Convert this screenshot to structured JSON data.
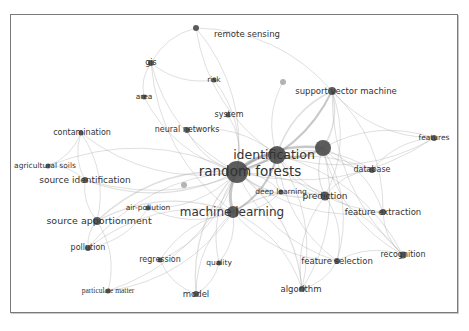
{
  "diagram": {
    "type": "keyword co-occurrence network",
    "colors": {
      "node": "#4a4a4a",
      "node_light": "#a0a0a0",
      "edge": "#9a9a9a",
      "frame": "#7a7a7a",
      "label": "#333333"
    },
    "nodes": [
      {
        "id": "random_forests",
        "label": "random forests",
        "x": 237,
        "y": 172,
        "r": 11,
        "lx": 250,
        "ly": 172,
        "fs": 13.5
      },
      {
        "id": "identification",
        "label": "identification",
        "x": 277,
        "y": 155,
        "r": 9,
        "lx": 274,
        "ly": 155,
        "fs": 12.5
      },
      {
        "id": "hub",
        "label": "",
        "x": 323,
        "y": 148,
        "r": 8,
        "lx": 0,
        "ly": 0,
        "fs": 0
      },
      {
        "id": "machine_learning",
        "label": "machine learning",
        "x": 233,
        "y": 212,
        "r": 6,
        "lx": 232,
        "ly": 212,
        "fs": 12
      },
      {
        "id": "support_vector_machine",
        "label": "support vector machine",
        "x": 332,
        "y": 91,
        "r": 4,
        "lx": 346,
        "ly": 91,
        "fs": 8.5
      },
      {
        "id": "remote_sensing",
        "label": "remote sensing",
        "x": 196,
        "y": 28,
        "r": 3,
        "lx": 247,
        "ly": 34,
        "fs": 8.5
      },
      {
        "id": "gis",
        "label": "gis",
        "x": 151,
        "y": 63,
        "r": 3,
        "lx": 151,
        "ly": 63,
        "fs": 8
      },
      {
        "id": "risk",
        "label": "risk",
        "x": 214,
        "y": 80,
        "r": 2.5,
        "lx": 214,
        "ly": 80,
        "fs": 7.5
      },
      {
        "id": "area",
        "label": "area",
        "x": 144,
        "y": 97,
        "r": 2.5,
        "lx": 144,
        "ly": 97,
        "fs": 7.5
      },
      {
        "id": "system",
        "label": "system",
        "x": 228,
        "y": 115,
        "r": 2.5,
        "lx": 229,
        "ly": 115,
        "fs": 8
      },
      {
        "id": "neural_networks",
        "label": "neural networks",
        "x": 187,
        "y": 130,
        "r": 3,
        "lx": 187,
        "ly": 130,
        "fs": 8
      },
      {
        "id": "contamination",
        "label": "contamination",
        "x": 81,
        "y": 133,
        "r": 2.5,
        "lx": 82,
        "ly": 133,
        "fs": 8
      },
      {
        "id": "agricultural_soils",
        "label": "agricultural soils",
        "x": 48,
        "y": 166,
        "r": 2.5,
        "lx": 45,
        "ly": 166,
        "fs": 7.5
      },
      {
        "id": "source_identification",
        "label": "source identification",
        "x": 85,
        "y": 180,
        "r": 3,
        "lx": 85,
        "ly": 180,
        "fs": 9
      },
      {
        "id": "air_pollution",
        "label": "air-pollution",
        "x": 148,
        "y": 208,
        "r": 2.5,
        "lx": 148,
        "ly": 208,
        "fs": 7.5
      },
      {
        "id": "source_apportionment",
        "label": "source apportionment",
        "x": 97,
        "y": 221,
        "r": 4,
        "lx": 99,
        "ly": 221,
        "fs": 9.5
      },
      {
        "id": "pollution",
        "label": "pollution",
        "x": 88,
        "y": 248,
        "r": 3,
        "lx": 88,
        "ly": 248,
        "fs": 8
      },
      {
        "id": "regression",
        "label": "regression",
        "x": 160,
        "y": 260,
        "r": 2.5,
        "lx": 160,
        "ly": 260,
        "fs": 8
      },
      {
        "id": "quality",
        "label": "quality",
        "x": 219,
        "y": 263,
        "r": 2.5,
        "lx": 219,
        "ly": 263,
        "fs": 7.5
      },
      {
        "id": "particulate_matter",
        "label": "particulate matter",
        "x": 108,
        "y": 291,
        "r": 2.5,
        "lx": 108,
        "ly": 291,
        "fs": 7.5
      },
      {
        "id": "model",
        "label": "model",
        "x": 196,
        "y": 294,
        "r": 3,
        "lx": 196,
        "ly": 294,
        "fs": 8.5
      },
      {
        "id": "algorithm",
        "label": "algorithm",
        "x": 302,
        "y": 289,
        "r": 3,
        "lx": 301,
        "ly": 289,
        "fs": 8.5
      },
      {
        "id": "feature_selection",
        "label": "feature selection",
        "x": 337,
        "y": 261,
        "r": 3,
        "lx": 337,
        "ly": 261,
        "fs": 8.5
      },
      {
        "id": "recognition",
        "label": "recognition",
        "x": 403,
        "y": 255,
        "r": 3.5,
        "lx": 403,
        "ly": 255,
        "fs": 8
      },
      {
        "id": "feature_extraction",
        "label": "feature extraction",
        "x": 383,
        "y": 212,
        "r": 3,
        "lx": 383,
        "ly": 212,
        "fs": 8.5
      },
      {
        "id": "prediction",
        "label": "prediction",
        "x": 325,
        "y": 196,
        "r": 4.5,
        "lx": 325,
        "ly": 196,
        "fs": 9
      },
      {
        "id": "deep_learning",
        "label": "deep learning",
        "x": 281,
        "y": 192,
        "r": 2.5,
        "lx": 281,
        "ly": 192,
        "fs": 7.5
      },
      {
        "id": "database",
        "label": "database",
        "x": 372,
        "y": 170,
        "r": 3,
        "lx": 372,
        "ly": 170,
        "fs": 8
      },
      {
        "id": "features",
        "label": "features",
        "x": 434,
        "y": 138,
        "r": 3,
        "lx": 434,
        "ly": 138,
        "fs": 7.5
      },
      {
        "id": "minor1",
        "label": "",
        "x": 283,
        "y": 82,
        "r": 3,
        "lx": 0,
        "ly": 0,
        "fs": 0,
        "light": true
      },
      {
        "id": "minor2",
        "label": "",
        "x": 184,
        "y": 185,
        "r": 3,
        "lx": 0,
        "ly": 0,
        "fs": 0,
        "light": true
      }
    ],
    "edges": [
      [
        "random_forests",
        "identification",
        3
      ],
      [
        "random_forests",
        "machine_learning",
        3
      ],
      [
        "random_forests",
        "hub",
        2.5
      ],
      [
        "identification",
        "hub",
        2.5
      ],
      [
        "identification",
        "machine_learning",
        2
      ],
      [
        "random_forests",
        "support_vector_machine",
        2
      ],
      [
        "identification",
        "support_vector_machine",
        1.5
      ],
      [
        "random_forests",
        "source_apportionment",
        1.5
      ],
      [
        "random_forests",
        "source_identification",
        1.2
      ],
      [
        "random_forests",
        "prediction",
        1.2
      ],
      [
        "random_forests",
        "deep_learning",
        1
      ],
      [
        "random_forests",
        "remote_sensing",
        1
      ],
      [
        "random_forests",
        "gis",
        1
      ],
      [
        "random_forests",
        "risk",
        1
      ],
      [
        "random_forests",
        "neural_networks",
        1
      ],
      [
        "random_forests",
        "system",
        1
      ],
      [
        "random_forests",
        "contamination",
        1
      ],
      [
        "random_forests",
        "agricultural_soils",
        1
      ],
      [
        "random_forests",
        "air_pollution",
        1
      ],
      [
        "random_forests",
        "pollution",
        1
      ],
      [
        "random_forests",
        "regression",
        1
      ],
      [
        "random_forests",
        "quality",
        1
      ],
      [
        "random_forests",
        "particulate_matter",
        1
      ],
      [
        "random_forests",
        "model",
        1.2
      ],
      [
        "random_forests",
        "algorithm",
        1.2
      ],
      [
        "random_forests",
        "feature_selection",
        1
      ],
      [
        "random_forests",
        "recognition",
        1
      ],
      [
        "random_forests",
        "feature_extraction",
        1
      ],
      [
        "random_forests",
        "database",
        1
      ],
      [
        "random_forests",
        "features",
        1
      ],
      [
        "random_forests",
        "area",
        1
      ],
      [
        "identification",
        "prediction",
        1
      ],
      [
        "identification",
        "database",
        1
      ],
      [
        "identification",
        "feature_extraction",
        1
      ],
      [
        "identification",
        "recognition",
        1
      ],
      [
        "identification",
        "features",
        1
      ],
      [
        "identification",
        "algorithm",
        1
      ],
      [
        "identification",
        "feature_selection",
        1
      ],
      [
        "identification",
        "remote_sensing",
        1
      ],
      [
        "identification",
        "neural_networks",
        1
      ],
      [
        "identification",
        "source_identification",
        1
      ],
      [
        "identification",
        "deep_learning",
        1
      ],
      [
        "identification",
        "minor1",
        1
      ],
      [
        "hub",
        "prediction",
        1.2
      ],
      [
        "hub",
        "features",
        1
      ],
      [
        "hub",
        "database",
        1
      ],
      [
        "hub",
        "algorithm",
        1
      ],
      [
        "hub",
        "recognition",
        1
      ],
      [
        "hub",
        "feature_extraction",
        1
      ],
      [
        "hub",
        "support_vector_machine",
        1.5
      ],
      [
        "hub",
        "feature_selection",
        1
      ],
      [
        "machine_learning",
        "source_apportionment",
        1.2
      ],
      [
        "machine_learning",
        "prediction",
        1.2
      ],
      [
        "machine_learning",
        "model",
        1
      ],
      [
        "machine_learning",
        "quality",
        1
      ],
      [
        "machine_learning",
        "regression",
        1
      ],
      [
        "machine_learning",
        "algorithm",
        1
      ],
      [
        "machine_learning",
        "pollution",
        1
      ],
      [
        "machine_learning",
        "air_pollution",
        1
      ],
      [
        "machine_learning",
        "deep_learning",
        1
      ],
      [
        "machine_learning",
        "particulate_matter",
        1
      ],
      [
        "machine_learning",
        "feature_selection",
        1
      ],
      [
        "machine_learning",
        "gis",
        1
      ],
      [
        "support_vector_machine",
        "features",
        1
      ],
      [
        "support_vector_machine",
        "prediction",
        1
      ],
      [
        "support_vector_machine",
        "recognition",
        1
      ],
      [
        "support_vector_machine",
        "feature_extraction",
        1
      ],
      [
        "support_vector_machine",
        "remote_sensing",
        1
      ],
      [
        "source_apportionment",
        "source_identification",
        1
      ],
      [
        "source_apportionment",
        "pollution",
        1
      ],
      [
        "source_apportionment",
        "particulate_matter",
        1
      ],
      [
        "source_apportionment",
        "contamination",
        1
      ],
      [
        "source_identification",
        "contamination",
        1
      ],
      [
        "source_identification",
        "agricultural_soils",
        1
      ],
      [
        "contamination",
        "agricultural_soils",
        1
      ],
      [
        "gis",
        "area",
        1
      ],
      [
        "gis",
        "remote_sensing",
        1
      ],
      [
        "gis",
        "risk",
        1
      ],
      [
        "prediction",
        "feature_selection",
        1
      ],
      [
        "prediction",
        "algorithm",
        1
      ],
      [
        "prediction",
        "database",
        1
      ],
      [
        "feature_extraction",
        "recognition",
        1
      ],
      [
        "feature_selection",
        "recognition",
        1
      ],
      [
        "algorithm",
        "feature_selection",
        1
      ],
      [
        "database",
        "features",
        1
      ],
      [
        "model",
        "quality",
        1
      ],
      [
        "model",
        "regression",
        1
      ],
      [
        "pollution",
        "air_pollution",
        1
      ]
    ]
  }
}
